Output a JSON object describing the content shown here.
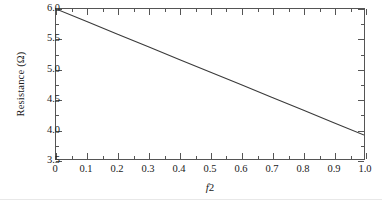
{
  "chart_data": {
    "type": "line",
    "title": "",
    "subtitle": "",
    "xlabel": "f2",
    "xlabel_italic_part": "f",
    "xlabel_plain_part": "2",
    "ylabel": "Resistance (Ω)",
    "xlim": [
      0,
      1.0
    ],
    "ylim": [
      3.5,
      6.0
    ],
    "grid": false,
    "legend": null,
    "legend_position": "none",
    "x_ticks": [
      0,
      0.1,
      0.2,
      0.3,
      0.4,
      0.5,
      0.6,
      0.7,
      0.8,
      0.9,
      1.0
    ],
    "x_tick_labels": [
      "0",
      "0.1",
      "0.2",
      "0.3",
      "0.4",
      "0.5",
      "0.6",
      "0.7",
      "0.8",
      "0.9",
      "1.0"
    ],
    "x_minor_tick_step": 0.05,
    "y_ticks": [
      3.5,
      4.0,
      4.5,
      5.0,
      5.5,
      6.0
    ],
    "y_tick_labels": [
      "3.5",
      "4.0",
      "4.5",
      "5.0",
      "5.5",
      "6.0"
    ],
    "y_minor_tick_step": 0.25,
    "series": [
      {
        "name": "Resistance vs f2",
        "color": "#3a3a3a",
        "linewidth": 1.1,
        "x": [
          0,
          0.1,
          0.2,
          0.3,
          0.4,
          0.5,
          0.6,
          0.7,
          0.8,
          0.9,
          1.0
        ],
        "values": [
          6.0,
          5.79,
          5.58,
          5.37,
          5.16,
          4.95,
          4.74,
          4.53,
          4.32,
          4.11,
          3.9
        ]
      }
    ],
    "annotations": []
  },
  "axes": {
    "y_title": "Resistance (Ω)",
    "x_title_italic": "f",
    "x_title_rest": "2"
  },
  "colors": {
    "line": "#3a3a3a",
    "spine": "#555555",
    "text": "#1a1a1a",
    "background": "#ffffff"
  }
}
